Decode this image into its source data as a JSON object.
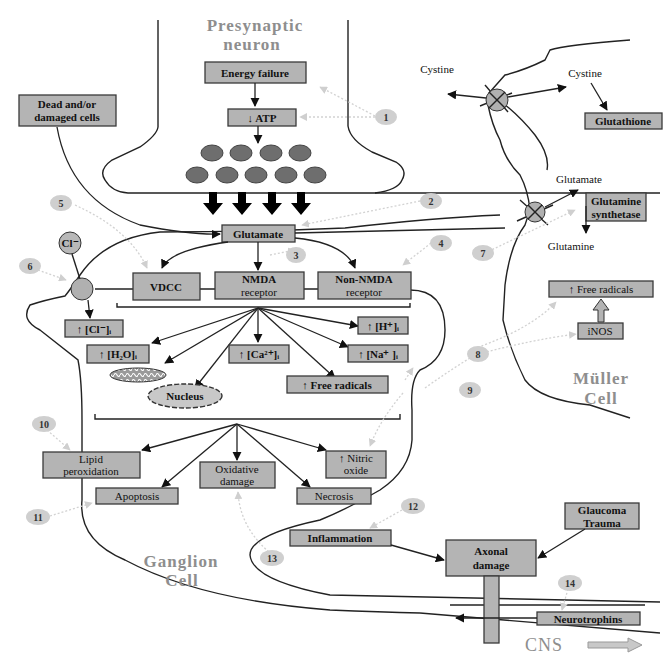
{
  "cells": {
    "presynaptic": [
      "Presynaptic",
      "neuron"
    ],
    "muller": [
      "Müller",
      "Cell"
    ],
    "ganglion": [
      "Ganglion",
      "Cell"
    ],
    "cns": "CNS"
  },
  "boxes": {
    "energy_failure": "Energy failure",
    "atp": "↓ ATP",
    "dead_cells": [
      "Dead and/or",
      "damaged cells"
    ],
    "glutamate": "Glutamate",
    "vdcc": "VDCC",
    "nmda": [
      "NMDA",
      "receptor"
    ],
    "non_nmda": [
      "Non-NMDA",
      "receptor"
    ],
    "cl_i": "↑ [Cl⁻]ᵢ",
    "h2o_i": "↑ [H₂O]ᵢ",
    "ca_i": "↑ [Ca²⁺]ᵢ",
    "h_i": "↑ [H⁺]ᵢ",
    "na_i": "↑ [Na⁺ ]ᵢ",
    "free_radicals": "↑ Free radicals",
    "nucleus": "Nucleus",
    "lipid_peroxidation": [
      "Lipid",
      "peroxidation"
    ],
    "oxidative_damage": [
      "Oxidative",
      "damage"
    ],
    "nitric_oxide": [
      "↑ Nitric",
      "oxide"
    ],
    "apoptosis": "Apoptosis",
    "necrosis": "Necrosis",
    "inflammation": "Inflammation",
    "axonal_damage": [
      "Axonal",
      "damage"
    ],
    "glaucoma_trauma": [
      "Glaucoma",
      "Trauma"
    ],
    "neurotrophins": "Neurotrophins",
    "glutathione": "Glutathione",
    "glutamine_synthetase": [
      "Glutamine",
      "synthetase"
    ],
    "muller_free_radicals": "↑ Free radicals",
    "inos": "iNOS"
  },
  "labels": {
    "cl_ion": "Cl⁻",
    "cystine_left": "Cystine",
    "cystine_right": "Cystine",
    "glutamate_muller": "Glutamate",
    "glutamine": "Glutamine"
  },
  "numbers": [
    "1",
    "2",
    "3",
    "4",
    "5",
    "6",
    "7",
    "8",
    "9",
    "10",
    "11",
    "12",
    "13",
    "14"
  ]
}
